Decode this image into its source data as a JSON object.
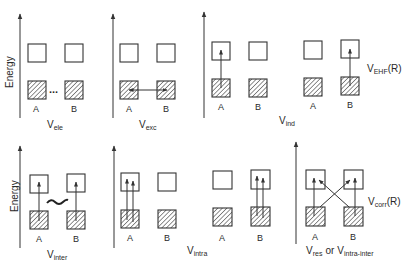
{
  "figure": {
    "y_axis_label": "Energy",
    "colors": {
      "ink": "#333333",
      "hatch": "#555555",
      "background": "#ffffff"
    }
  },
  "top_row": {
    "panels": [
      {
        "name": "V_ele",
        "label_main": "V",
        "label_sub": "ele",
        "monomers": [
          "A",
          "B"
        ],
        "connector": "dots"
      },
      {
        "name": "V_exc",
        "label_main": "V",
        "label_sub": "exc",
        "monomers": [
          "A",
          "B"
        ],
        "connector": "double-arrow between occupied levels"
      },
      {
        "name": "V_ind",
        "label_main": "V",
        "label_sub": "ind",
        "monomers": [
          "A",
          "B",
          "A",
          "B"
        ],
        "connector": "excitation arrows on A (left pair) and on B (right pair)"
      }
    ],
    "group_label": {
      "main": "V",
      "sub": "EHF",
      "suffix": "(R)"
    }
  },
  "bottom_row": {
    "panels": [
      {
        "name": "V_inter",
        "label_main": "V",
        "label_sub": "inter",
        "monomers": [
          "A",
          "B"
        ],
        "connector": "wavy coupling between single excitations on A and B"
      },
      {
        "name": "V_intra",
        "label_main": "V",
        "label_sub": "intra",
        "monomers": [
          "A",
          "B",
          "A",
          "B"
        ],
        "connector": "double excitations within A (left pair) and within B (right pair)"
      },
      {
        "name": "V_res",
        "label_main": "V",
        "label_sub": "res",
        "or_text": "or",
        "label2_main": "V",
        "label2_sub": "intra-inter",
        "monomers": [
          "A",
          "B"
        ],
        "connector": "crossed excitations A to B and B to A"
      }
    ],
    "group_label": {
      "main": "V",
      "sub": "corr",
      "suffix": "(R)"
    }
  },
  "monomer_labels": {
    "a": "A",
    "b": "B"
  },
  "dots": "..."
}
